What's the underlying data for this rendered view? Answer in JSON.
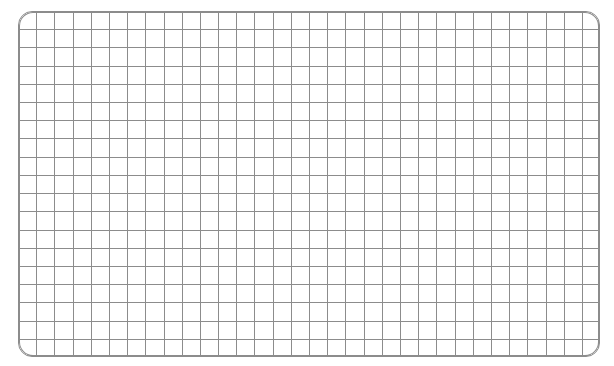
{
  "panel": {
    "name": "grid-panel",
    "type": "graph-paper-grid",
    "label": "",
    "geometry": {
      "x": 18,
      "y": 11,
      "width": 582,
      "height": 346,
      "corner_radius": 14
    },
    "grid": {
      "columns": 32,
      "rows": 19,
      "cell_width": 18.19,
      "cell_height": 18.21,
      "line_width": 1
    },
    "colors": {
      "background": "#ffffff",
      "grid_line": "#8c8c8c",
      "border": "#8c8c8c",
      "page_background": "#ffffff"
    }
  },
  "chart_data": {
    "type": "table",
    "title": "",
    "subtitle": "",
    "xlabel": "",
    "ylabel": "",
    "categories": [],
    "values": [],
    "grid": true,
    "legend": "none",
    "annotations": []
  }
}
